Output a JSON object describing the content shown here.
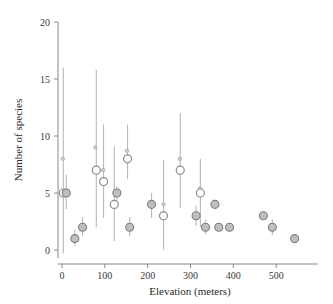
{
  "chart_data": {
    "type": "scatter",
    "title": "",
    "xlabel": "Elevation (meters)",
    "ylabel": "Number of species",
    "xlim": [
      -30,
      580
    ],
    "ylim": [
      0,
      20
    ],
    "xticks": [
      0,
      100,
      200,
      300,
      400,
      500
    ],
    "yticks": [
      0,
      5,
      10,
      15,
      20
    ],
    "xtick_labels": [
      "0",
      "100",
      "200",
      "300",
      "400",
      "500"
    ],
    "ytick_labels": [
      "0",
      "5",
      "10",
      "15",
      "20"
    ],
    "grid": false,
    "legend": null,
    "marker_styles": {
      "open": "open-circle",
      "filled": "filled-circle",
      "small": "small-dot"
    },
    "series": [
      {
        "name": "Number of species vs elevation",
        "points": [
          {
            "x": 2,
            "y": 8,
            "style": "small",
            "err_low": null,
            "err_high": null
          },
          {
            "x": 3,
            "y": 5,
            "style": "open",
            "err_low": -0.3,
            "err_high": 16.0
          },
          {
            "x": 10,
            "y": 5,
            "style": "filled",
            "err_low": 3.6,
            "err_high": 6.6
          },
          {
            "x": 30,
            "y": 1,
            "style": "filled",
            "err_low": 0.3,
            "err_high": 1.8
          },
          {
            "x": 48,
            "y": 2,
            "style": "filled",
            "err_low": 1.2,
            "err_high": 2.9
          },
          {
            "x": 78,
            "y": 9,
            "style": "small",
            "err_low": null,
            "err_high": null
          },
          {
            "x": 80,
            "y": 7,
            "style": "open",
            "err_low": 2.0,
            "err_high": 15.8
          },
          {
            "x": 96,
            "y": 7,
            "style": "small",
            "err_low": null,
            "err_high": null
          },
          {
            "x": 97,
            "y": 6,
            "style": "open",
            "err_low": 2.8,
            "err_high": 11.0
          },
          {
            "x": 122,
            "y": 4,
            "style": "open",
            "err_low": 0.8,
            "err_high": 9.1
          },
          {
            "x": 128,
            "y": 5,
            "style": "filled",
            "err_low": 4.3,
            "err_high": 5.6
          },
          {
            "x": 152,
            "y": 8.7,
            "style": "small",
            "err_low": null,
            "err_high": null
          },
          {
            "x": 153,
            "y": 8,
            "style": "open",
            "err_low": 6.2,
            "err_high": 11.0
          },
          {
            "x": 158,
            "y": 2,
            "style": "filled",
            "err_low": 1.2,
            "err_high": 2.9
          },
          {
            "x": 209,
            "y": 4,
            "style": "filled",
            "err_low": 2.8,
            "err_high": 5.0
          },
          {
            "x": 237,
            "y": 4,
            "style": "small",
            "err_low": null,
            "err_high": null
          },
          {
            "x": 237,
            "y": 3,
            "style": "open",
            "err_low": 0.0,
            "err_high": 7.9
          },
          {
            "x": 275,
            "y": 8,
            "style": "small",
            "err_low": null,
            "err_high": null
          },
          {
            "x": 276,
            "y": 7,
            "style": "open",
            "err_low": 3.7,
            "err_high": 12.0
          },
          {
            "x": 313,
            "y": 3,
            "style": "filled",
            "err_low": 2.1,
            "err_high": 3.9
          },
          {
            "x": 322,
            "y": 5.4,
            "style": "small",
            "err_low": null,
            "err_high": null
          },
          {
            "x": 323,
            "y": 5,
            "style": "open",
            "err_low": 2.0,
            "err_high": 8.0
          },
          {
            "x": 335,
            "y": 2,
            "style": "filled",
            "err_low": 1.4,
            "err_high": 2.7
          },
          {
            "x": 357,
            "y": 4,
            "style": "filled",
            "err_low": null,
            "err_high": null
          },
          {
            "x": 366,
            "y": 2,
            "style": "filled",
            "err_low": null,
            "err_high": null
          },
          {
            "x": 391,
            "y": 2,
            "style": "filled",
            "err_low": null,
            "err_high": null
          },
          {
            "x": 470,
            "y": 3,
            "style": "filled",
            "err_low": null,
            "err_high": null
          },
          {
            "x": 491,
            "y": 2,
            "style": "filled",
            "err_low": 1.3,
            "err_high": 2.7
          },
          {
            "x": 543,
            "y": 1,
            "style": "filled",
            "err_low": null,
            "err_high": null
          }
        ]
      }
    ]
  },
  "axes": {
    "x_title": "Elevation (meters)",
    "y_title": "Number of species"
  }
}
